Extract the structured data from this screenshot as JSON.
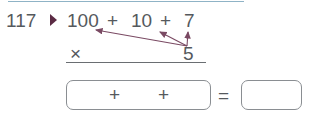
{
  "problem": {
    "number": "117",
    "terms": [
      "100",
      "+",
      "10",
      "+",
      "7"
    ],
    "operator": "×",
    "multiplier": "5",
    "answer_row": {
      "plus1": "+",
      "plus2": "+",
      "equals": "="
    }
  },
  "colors": {
    "marker": "#5b2b44",
    "arrow": "#7a4a63",
    "text": "#55595d",
    "top_rule": "#8fb3c6"
  }
}
